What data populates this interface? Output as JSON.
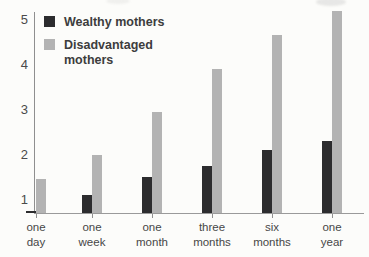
{
  "chart_data": {
    "type": "bar",
    "title": "",
    "xlabel": "",
    "ylabel": "",
    "categories": [
      "one day",
      "one week",
      "one month",
      "three months",
      "six months",
      "one year"
    ],
    "series": [
      {
        "name": "Wealthy mothers",
        "color": "#2c2c2e",
        "values": [
          0.75,
          1.1,
          1.5,
          1.75,
          2.1,
          2.3
        ]
      },
      {
        "name": "Disadvantaged mothers",
        "color": "#b3b3b3",
        "values": [
          1.45,
          2.0,
          2.95,
          3.9,
          4.65,
          5.2
        ]
      }
    ],
    "yticks": [
      1,
      2,
      3,
      4,
      5
    ],
    "ylim": [
      0.7,
      5.5
    ],
    "grid": false,
    "legend_position": "top-left"
  }
}
